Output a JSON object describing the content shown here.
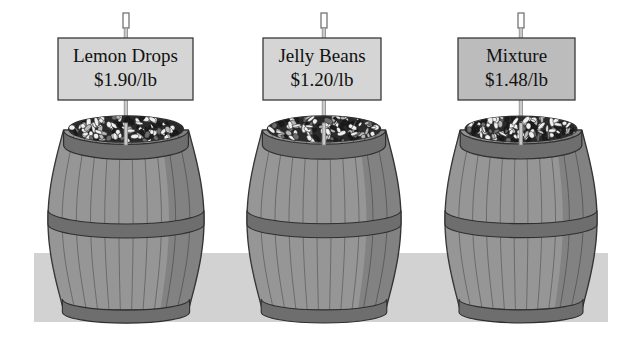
{
  "scene": {
    "title": "Candy barrels price display",
    "background_color": "#ffffff",
    "ground": {
      "label": "floor-band",
      "color": "#d2d2d2",
      "x": 34,
      "y": 253,
      "width": 574,
      "height": 69
    },
    "barrels": [
      {
        "id": "barrel-lemon-drops",
        "sign": {
          "name": "Lemon Drops",
          "price": "$1.90/lb",
          "fill_color": "#d5d5d5",
          "border_color": "#3a3a3a",
          "x": 58,
          "y": 38,
          "width": 135,
          "height": 62
        },
        "post": {
          "x": 123,
          "top": 13,
          "bottom": 152,
          "color": "#c9c9c9"
        },
        "body": {
          "center_x": 126,
          "top_y": 130,
          "bottom_y": 310,
          "max_half_width": 78,
          "stave_color": "#8b8b8b",
          "stave_light": "#9c9c9c",
          "hoop_color": "#6e6e6e",
          "outline_color": "#2f2f2f",
          "candy_dark": "#2a2a2a",
          "candy_light": "#f0f0f0"
        }
      },
      {
        "id": "barrel-jelly-beans",
        "sign": {
          "name": "Jelly Beans",
          "price": "$1.20/lb",
          "fill_color": "#d5d5d5",
          "border_color": "#3a3a3a",
          "x": 263,
          "y": 38,
          "width": 118,
          "height": 62
        },
        "post": {
          "x": 321,
          "top": 13,
          "bottom": 152,
          "color": "#c9c9c9"
        },
        "body": {
          "center_x": 324,
          "top_y": 130,
          "bottom_y": 310,
          "max_half_width": 77,
          "stave_color": "#8b8b8b",
          "stave_light": "#9c9c9c",
          "hoop_color": "#6e6e6e",
          "outline_color": "#2f2f2f",
          "candy_dark": "#2a2a2a",
          "candy_light": "#f0f0f0"
        }
      },
      {
        "id": "barrel-mixture",
        "sign": {
          "name": "Mixture",
          "price": "$1.48/lb",
          "fill_color": "#bcbcbc",
          "border_color": "#3a3a3a",
          "x": 458,
          "y": 38,
          "width": 117,
          "height": 62
        },
        "post": {
          "x": 518,
          "top": 13,
          "bottom": 152,
          "color": "#c9c9c9"
        },
        "body": {
          "center_x": 521,
          "top_y": 130,
          "bottom_y": 310,
          "max_half_width": 76,
          "stave_color": "#8b8b8b",
          "stave_light": "#9c9c9c",
          "hoop_color": "#6e6e6e",
          "outline_color": "#2f2f2f",
          "candy_dark": "#2a2a2a",
          "candy_light": "#f0f0f0"
        }
      }
    ]
  }
}
